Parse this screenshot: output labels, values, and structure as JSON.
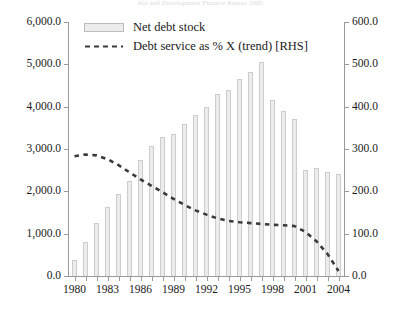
{
  "figure": {
    "source_caption": "Aid and Development Finance Report 2005",
    "legend": [
      {
        "key": "bars",
        "label": "Net debt stock",
        "marker": "filled-rectangle-swatch",
        "color": "#ececec"
      },
      {
        "key": "trend",
        "label": "Debt service as % X (trend) [RHS]",
        "marker": "dashed-line-swatch",
        "color": "#3a3a3a"
      }
    ]
  },
  "chart_data": {
    "type": "bar",
    "title": "",
    "xlabel": "",
    "ylabel": "",
    "grid": false,
    "legend_position": "top-left-inside",
    "x": [
      1980,
      1981,
      1982,
      1983,
      1984,
      1985,
      1986,
      1987,
      1988,
      1989,
      1990,
      1991,
      1992,
      1993,
      1994,
      1995,
      1996,
      1997,
      1998,
      1999,
      2000,
      2001,
      2002,
      2003,
      2004
    ],
    "categories": [
      "1980",
      "1981",
      "1982",
      "1983",
      "1984",
      "1985",
      "1986",
      "1987",
      "1988",
      "1989",
      "1990",
      "1991",
      "1992",
      "1993",
      "1994",
      "1995",
      "1996",
      "1997",
      "1998",
      "1999",
      "2000",
      "2001",
      "2002",
      "2003",
      "2004"
    ],
    "xtick_labels": [
      "1980",
      "1983",
      "1986",
      "1989",
      "1992",
      "1995",
      "1998",
      "2001",
      "2004"
    ],
    "xtick_values": [
      1980,
      1983,
      1986,
      1989,
      1992,
      1995,
      1998,
      2001,
      2004
    ],
    "axes": {
      "left": {
        "name": "Net debt stock",
        "ylim": [
          0,
          6000
        ],
        "ticks": [
          0,
          1000,
          2000,
          3000,
          4000,
          5000,
          6000
        ],
        "tick_labels": [
          "0.0",
          "1,000.0",
          "2,000.0",
          "3,000.0",
          "4,000.0",
          "5,000.0",
          "6,000.0"
        ]
      },
      "right": {
        "name": "Debt service as % X (trend)",
        "ylim": [
          0,
          600
        ],
        "ticks": [
          0,
          100,
          200,
          300,
          400,
          500,
          600
        ],
        "tick_labels": [
          "0.0",
          "100.0",
          "200.0",
          "300.0",
          "400.0",
          "500.0",
          "600.0"
        ]
      }
    },
    "series": [
      {
        "name": "Net debt stock",
        "type": "bar",
        "axis": "left",
        "color": "#ececec",
        "edge_color": "#cdcdcd",
        "values": [
          380,
          800,
          1250,
          1620,
          1930,
          2250,
          2750,
          3080,
          3280,
          3350,
          3600,
          3800,
          4000,
          4300,
          4400,
          4650,
          4820,
          5050,
          4150,
          3900,
          3720,
          2500,
          2540,
          2450,
          2400
        ]
      },
      {
        "name": "Debt service as % X (trend) [RHS]",
        "type": "line",
        "style": "dashed",
        "axis": "right",
        "color": "#3a3a3a",
        "values": [
          283,
          287,
          285,
          276,
          262,
          245,
          228,
          213,
          198,
          182,
          168,
          155,
          145,
          136,
          130,
          127,
          125,
          123,
          121,
          120,
          118,
          104,
          82,
          52,
          12
        ]
      }
    ]
  }
}
